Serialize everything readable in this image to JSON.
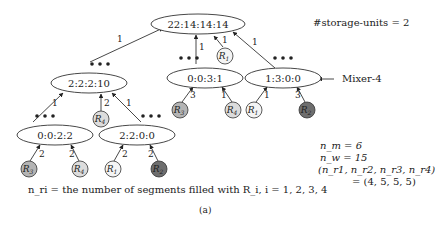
{
  "storage_label": "#storage-units = 2",
  "mixer_label": "Mixer-4",
  "nodes": {
    "root": "22:14:14:14",
    "l1_left": "2:2:2:10",
    "l1_mid": "0:0:3:1",
    "l1_right": "1:3:0:0",
    "l2_left": "0:0:2:2",
    "l2_right": "2:2:0:0"
  },
  "edge_labels": {
    "root_from_l1_left": "1",
    "root_from_l1_mid": "1",
    "root_from_r1": "1",
    "root_from_l1_right": "1",
    "l1_left_from_l2_left": "1",
    "l1_left_from_r4": "2",
    "l1_left_from_l2_right": "1",
    "l1_mid_from_r3": "3",
    "l1_mid_from_r4": "1",
    "l1_right_from_r1": "1",
    "l1_right_from_r2": "3",
    "l2_left_from_r3": "2",
    "l2_left_from_r4": "2",
    "l2_right_from_r1": "2",
    "l2_right_from_r2": "2"
  },
  "reagents": {
    "R1": {
      "label": "R",
      "sub": "1",
      "fill": "#f4f4f4"
    },
    "R2": {
      "label": "R",
      "sub": "2",
      "fill": "#6e6e6e"
    },
    "R3": {
      "label": "R",
      "sub": "3",
      "fill": "#b4b4b4"
    },
    "R4": {
      "label": "R",
      "sub": "4",
      "fill": "#dcdcdc"
    }
  },
  "stats": {
    "nm": "n_m = 6",
    "nw": "n_w = 15",
    "tuple": "(n_r1, n_r2, n_r3, n_r4)",
    "tuple_value": "= (4, 5, 5, 5)"
  },
  "legend": "n_ri = the number of segments filled with R_i, i = 1, 2, 3, 4",
  "caption": "(a)"
}
